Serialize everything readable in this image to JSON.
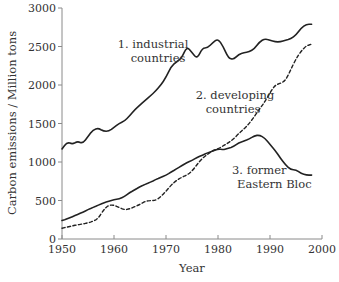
{
  "chart_data": {
    "type": "line",
    "title": "",
    "xlabel": "Year",
    "ylabel": "Carbon emissions / Million tons",
    "xlim": [
      1950,
      2000
    ],
    "ylim": [
      0,
      3000
    ],
    "xticks": [
      1950,
      1960,
      1970,
      1980,
      1990,
      2000
    ],
    "yticks": [
      0,
      500,
      1000,
      1500,
      2000,
      2500,
      3000
    ],
    "grid": false,
    "legend": "inline labels",
    "series": [
      {
        "name": "industrial countries",
        "label_lines": [
          "1. industrial",
          "countries"
        ],
        "style": "solid",
        "x": [
          1950,
          1951,
          1952,
          1953,
          1954,
          1955,
          1956,
          1957,
          1958,
          1959,
          1960,
          1961,
          1962,
          1963,
          1964,
          1965,
          1966,
          1967,
          1968,
          1969,
          1970,
          1971,
          1972,
          1973,
          1974,
          1975,
          1976,
          1977,
          1978,
          1979,
          1980,
          1981,
          1982,
          1983,
          1984,
          1985,
          1986,
          1987,
          1988,
          1989,
          1990,
          1991,
          1992,
          1993,
          1994,
          1995,
          1996,
          1997,
          1998
        ],
        "values": [
          1170,
          1260,
          1230,
          1270,
          1240,
          1330,
          1420,
          1440,
          1400,
          1400,
          1450,
          1500,
          1530,
          1600,
          1680,
          1740,
          1800,
          1860,
          1920,
          2000,
          2100,
          2240,
          2300,
          2350,
          2500,
          2420,
          2340,
          2480,
          2480,
          2550,
          2600,
          2500,
          2350,
          2330,
          2400,
          2420,
          2430,
          2470,
          2560,
          2600,
          2580,
          2560,
          2560,
          2580,
          2600,
          2650,
          2740,
          2790,
          2790
        ]
      },
      {
        "name": "developing countries",
        "label_lines": [
          "2. developing",
          "countries"
        ],
        "style": "dashed",
        "x": [
          1950,
          1951,
          1952,
          1953,
          1954,
          1955,
          1956,
          1957,
          1958,
          1959,
          1960,
          1961,
          1962,
          1963,
          1964,
          1965,
          1966,
          1967,
          1968,
          1969,
          1970,
          1971,
          1972,
          1973,
          1974,
          1975,
          1976,
          1977,
          1978,
          1979,
          1980,
          1981,
          1982,
          1983,
          1984,
          1985,
          1986,
          1987,
          1988,
          1989,
          1990,
          1991,
          1992,
          1993,
          1994,
          1995,
          1996,
          1997,
          1998
        ],
        "values": [
          140,
          155,
          170,
          185,
          195,
          210,
          230,
          270,
          380,
          440,
          440,
          410,
          380,
          390,
          420,
          450,
          490,
          500,
          500,
          550,
          620,
          700,
          760,
          800,
          830,
          880,
          970,
          1050,
          1100,
          1150,
          1170,
          1210,
          1250,
          1300,
          1370,
          1430,
          1500,
          1590,
          1690,
          1780,
          1900,
          2000,
          2020,
          2060,
          2200,
          2340,
          2440,
          2510,
          2530
        ]
      },
      {
        "name": "former Eastern Bloc",
        "label_lines": [
          "3. former",
          "Eastern Bloc"
        ],
        "style": "solid",
        "x": [
          1950,
          1951,
          1952,
          1953,
          1954,
          1955,
          1956,
          1957,
          1958,
          1959,
          1960,
          1961,
          1962,
          1963,
          1964,
          1965,
          1966,
          1967,
          1968,
          1969,
          1970,
          1971,
          1972,
          1973,
          1974,
          1975,
          1976,
          1977,
          1978,
          1979,
          1980,
          1981,
          1982,
          1983,
          1984,
          1985,
          1986,
          1987,
          1988,
          1989,
          1990,
          1991,
          1992,
          1993,
          1994,
          1995,
          1996,
          1997,
          1998
        ],
        "values": [
          240,
          260,
          290,
          320,
          350,
          380,
          410,
          440,
          470,
          490,
          510,
          520,
          550,
          600,
          640,
          680,
          710,
          740,
          770,
          800,
          830,
          870,
          910,
          950,
          990,
          1020,
          1060,
          1090,
          1120,
          1140,
          1170,
          1160,
          1180,
          1200,
          1250,
          1270,
          1300,
          1340,
          1350,
          1310,
          1230,
          1150,
          1050,
          960,
          900,
          900,
          850,
          830,
          830
        ]
      }
    ]
  }
}
